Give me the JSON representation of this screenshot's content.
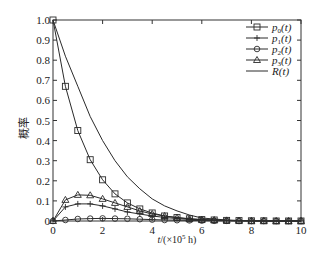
{
  "chart_data": {
    "type": "line",
    "title": "",
    "xlabel": "t/(×10⁵ h)",
    "ylabel": "概率",
    "xlim": [
      0,
      10
    ],
    "ylim": [
      0,
      1.0
    ],
    "x_ticks": [
      "0",
      "2",
      "4",
      "6",
      "8",
      "10"
    ],
    "y_ticks": [
      "0",
      "0.1",
      "0.2",
      "0.3",
      "0.4",
      "0.5",
      "0.6",
      "0.7",
      "0.8",
      "0.9",
      "1.0"
    ],
    "grid": false,
    "legend_position": "upper right",
    "x": [
      0,
      0.5,
      1.0,
      1.5,
      2.0,
      2.5,
      3.0,
      3.5,
      4.0,
      4.5,
      5.0,
      5.5,
      6.0,
      6.5,
      7.0,
      7.5,
      8.0,
      8.5,
      9.0,
      9.5,
      10.0
    ],
    "series": [
      {
        "name": "p0(t)",
        "label_base": "p",
        "label_sub": "0",
        "marker": "square",
        "values": [
          1.0,
          0.67,
          0.45,
          0.305,
          0.205,
          0.135,
          0.09,
          0.06,
          0.04,
          0.025,
          0.017,
          0.011,
          0.007,
          0.005,
          0.003,
          0.002,
          0.001,
          0.001,
          0.0,
          0.0,
          0.0
        ]
      },
      {
        "name": "p1(t)",
        "label_base": "p",
        "label_sub": "1",
        "marker": "plus",
        "values": [
          0.0,
          0.07,
          0.085,
          0.085,
          0.075,
          0.06,
          0.045,
          0.035,
          0.025,
          0.018,
          0.012,
          0.008,
          0.005,
          0.003,
          0.002,
          0.001,
          0.001,
          0.0,
          0.0,
          0.0,
          0.0
        ]
      },
      {
        "name": "p2(t)",
        "label_base": "p",
        "label_sub": "2",
        "marker": "circle",
        "values": [
          0.0,
          0.005,
          0.01,
          0.012,
          0.013,
          0.012,
          0.011,
          0.009,
          0.007,
          0.005,
          0.004,
          0.003,
          0.002,
          0.001,
          0.001,
          0.0,
          0.0,
          0.0,
          0.0,
          0.0,
          0.0
        ]
      },
      {
        "name": "p3(t)",
        "label_base": "p",
        "label_sub": "3",
        "marker": "triangle",
        "values": [
          0.0,
          0.105,
          0.13,
          0.128,
          0.11,
          0.09,
          0.07,
          0.05,
          0.035,
          0.025,
          0.017,
          0.011,
          0.007,
          0.005,
          0.003,
          0.002,
          0.001,
          0.001,
          0.0,
          0.0,
          0.0
        ]
      },
      {
        "name": "R(t)",
        "label_base": "R",
        "label_sub": "",
        "marker": "none",
        "values": [
          1.0,
          0.82,
          0.67,
          0.52,
          0.4,
          0.3,
          0.22,
          0.16,
          0.11,
          0.075,
          0.05,
          0.03,
          0.015,
          0.01,
          0.005,
          0.003,
          0.001,
          0.0,
          0.0,
          0.0,
          0.0
        ]
      }
    ]
  },
  "axes": {
    "xlabel_prefix": "t",
    "xlabel_rest": "/(×10",
    "xlabel_exp": "5",
    "xlabel_unit": " h)",
    "ylabel": "概率"
  },
  "colors": {
    "line": "#2a2a2a",
    "axis": "#333333",
    "background": "#ffffff"
  }
}
